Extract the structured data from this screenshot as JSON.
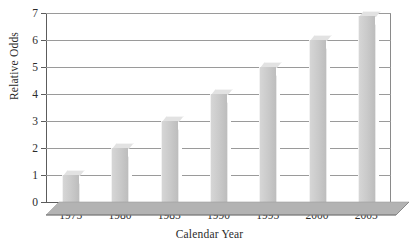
{
  "chart_data": {
    "type": "bar",
    "title": "",
    "xlabel": "Calendar Year",
    "ylabel": "Relative Odds",
    "categories": [
      "1975",
      "1980",
      "1985",
      "1990",
      "1995",
      "2000",
      "2005"
    ],
    "values": [
      1,
      2,
      3,
      4,
      5,
      6,
      6.9
    ],
    "ylim": [
      0,
      7
    ],
    "ytick_labels": [
      "0",
      "1",
      "2",
      "3",
      "4",
      "5",
      "6",
      "7"
    ],
    "ytick_values": [
      0,
      1,
      2,
      3,
      4,
      5,
      6,
      7
    ],
    "grid": true,
    "legend": false,
    "style": "3d-bar",
    "bar_color": "#c9c9c9",
    "floor_color": "#b3b3b3",
    "gridline_color": "#9a9a9a",
    "axis_color": "#5c5c5c",
    "background": "#ffffff"
  }
}
